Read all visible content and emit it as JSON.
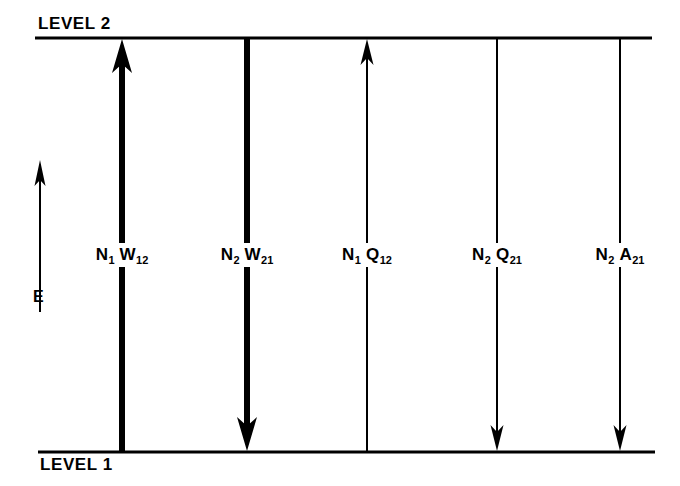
{
  "figure": {
    "type": "energy-level-transition-diagram",
    "background_color": "#ffffff",
    "line_color": "#000000",
    "levels": {
      "upper": {
        "label": "LEVEL 2",
        "y": 38,
        "x_start": 35,
        "x_end": 652,
        "thickness": 3
      },
      "lower": {
        "label": "LEVEL 1",
        "y": 452,
        "x_start": 38,
        "x_end": 655,
        "thickness": 3
      }
    },
    "energy_axis": {
      "label": "E",
      "direction": "up",
      "x": 40,
      "y_tail": 312,
      "y_head": 160
    },
    "transitions": [
      {
        "id": "n1w12",
        "species": "N",
        "species_sub": "1",
        "rate": "W",
        "rate_sub": "12",
        "label_text": "N1 W12",
        "x": 122,
        "direction": "up",
        "thickness": "thick",
        "stroke_width": 6,
        "arrow_size": "large"
      },
      {
        "id": "n2w21",
        "species": "N",
        "species_sub": "2",
        "rate": "W",
        "rate_sub": "21",
        "label_text": "N2 W21",
        "x": 247,
        "direction": "down",
        "thickness": "thick",
        "stroke_width": 6,
        "arrow_size": "large"
      },
      {
        "id": "n1q12",
        "species": "N",
        "species_sub": "1",
        "rate": "Q",
        "rate_sub": "12",
        "label_text": "N1 Q12",
        "x": 367,
        "direction": "up",
        "thickness": "thin",
        "stroke_width": 2,
        "arrow_size": "small"
      },
      {
        "id": "n2q21",
        "species": "N",
        "species_sub": "2",
        "rate": "Q",
        "rate_sub": "21",
        "label_text": "N2 Q21",
        "x": 497,
        "direction": "down",
        "thickness": "thin",
        "stroke_width": 2,
        "arrow_size": "small"
      },
      {
        "id": "n2a21",
        "species": "N",
        "species_sub": "2",
        "rate": "A",
        "rate_sub": "21",
        "label_text": "N2 A21",
        "x": 620,
        "direction": "down",
        "thickness": "thin",
        "stroke_width": 2,
        "arrow_size": "small"
      }
    ]
  }
}
